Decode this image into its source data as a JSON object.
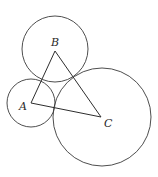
{
  "diagram": {
    "type": "geometry",
    "stroke_color": "#3a3a3a",
    "background": "#ffffff",
    "vertices": {
      "A": {
        "label": "A",
        "x": 31,
        "y": 103
      },
      "B": {
        "label": "B",
        "x": 55,
        "y": 51
      },
      "C": {
        "label": "C",
        "x": 101,
        "y": 117
      }
    },
    "circles": [
      {
        "center": "A",
        "cx": 31,
        "cy": 103,
        "r": 24
      },
      {
        "center": "B",
        "cx": 55,
        "cy": 49,
        "r": 33
      },
      {
        "center": "C",
        "cx": 102,
        "cy": 117,
        "r": 49
      }
    ],
    "edges": [
      [
        "A",
        "B"
      ],
      [
        "B",
        "C"
      ],
      [
        "C",
        "A"
      ]
    ],
    "labels": {
      "A": {
        "text": "A",
        "x": 19,
        "y": 110
      },
      "B": {
        "text": "B",
        "x": 51,
        "y": 46
      },
      "C": {
        "text": "C",
        "x": 104,
        "y": 127
      }
    }
  }
}
